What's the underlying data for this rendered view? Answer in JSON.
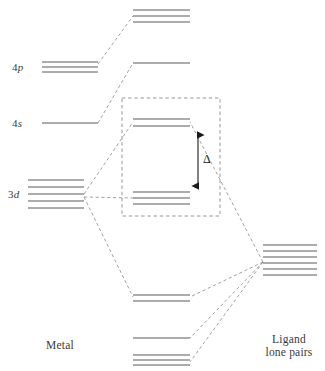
{
  "figure": {
    "type": "molecular-orbital-energy-diagram",
    "background_color": "#ffffff",
    "level_color": "#5a5a5a",
    "correlation_color": "#8a8a8a",
    "box_color": "#8a8a8a",
    "arrow_color": "#1a1a1a"
  },
  "labels": {
    "metal": "Metal",
    "ligand_line1": "Ligand",
    "ligand_line2": "lone pairs",
    "four_p_prefix": "4",
    "four_p_orbital": "p",
    "four_s_prefix": "4",
    "four_s_orbital": "s",
    "three_d_prefix": "3",
    "three_d_orbital": "d",
    "delta": "Δ"
  },
  "chart_data": {
    "type": "energy-level-diagram",
    "xlabel": "",
    "ylabel": "Energy",
    "grid": false,
    "legend": "none",
    "columns": [
      {
        "id": "metal",
        "name": "Metal",
        "x_center": 70,
        "levels": [
          {
            "id": "4p",
            "label": "4p",
            "degeneracy": 3,
            "x1": 42,
            "x2": 98,
            "y": [
              62,
              67,
              72
            ],
            "label_x": 12,
            "label_y": 61
          },
          {
            "id": "4s",
            "label": "4s",
            "degeneracy": 1,
            "x1": 42,
            "x2": 98,
            "y": [
              123
            ],
            "label_x": 12,
            "label_y": 117
          },
          {
            "id": "3d",
            "label": "3d",
            "degeneracy": 5,
            "x1": 28,
            "x2": 84,
            "y": [
              180,
              187,
              194,
              201,
              208
            ],
            "label_x": 8,
            "label_y": 188
          }
        ]
      },
      {
        "id": "molecular",
        "name": "Molecular orbitals",
        "x_center": 163,
        "levels": [
          {
            "id": "t1u-antibonding",
            "label": "t1u*",
            "degeneracy": 3,
            "x1": 133,
            "x2": 190,
            "y": [
              10,
              16,
              22
            ]
          },
          {
            "id": "a1g-antibonding",
            "label": "a1g*",
            "degeneracy": 1,
            "x1": 133,
            "x2": 190,
            "y": [
              63
            ]
          },
          {
            "id": "eg-antibonding",
            "label": "eg*",
            "degeneracy": 2,
            "x1": 133,
            "x2": 190,
            "y": [
              119,
              126
            ],
            "in_box": true
          },
          {
            "id": "t2g-nonbonding",
            "label": "t2g",
            "degeneracy": 3,
            "x1": 133,
            "x2": 190,
            "y": [
              192,
              198,
              204
            ],
            "in_box": true
          },
          {
            "id": "eg-bonding",
            "label": "eg",
            "degeneracy": 2,
            "x1": 133,
            "x2": 190,
            "y": [
              295,
              301
            ]
          },
          {
            "id": "a1g-bonding",
            "label": "a1g",
            "degeneracy": 1,
            "x1": 133,
            "x2": 190,
            "y": [
              338
            ]
          },
          {
            "id": "t1u-bonding",
            "label": "t1u",
            "degeneracy": 3,
            "x1": 133,
            "x2": 190,
            "y": [
              355,
              360,
              365
            ]
          }
        ]
      },
      {
        "id": "ligand",
        "name": "Ligand lone pairs",
        "x_center": 289,
        "levels": [
          {
            "id": "ligand-lone-pairs",
            "label": "Ligand lone pairs",
            "degeneracy": 6,
            "x1": 263,
            "x2": 317,
            "y": [
              245,
              251,
              257,
              263,
              269,
              275
            ]
          }
        ]
      }
    ],
    "splitting": {
      "symbol": "Δ",
      "from_level": "t2g-nonbonding",
      "to_level": "eg-antibonding",
      "arrow_x": 198,
      "arrow_y_top": 131,
      "arrow_y_bottom": 190,
      "label_x": 203,
      "label_y": 152
    },
    "box": {
      "x": 122,
      "y": 98,
      "width": 98,
      "height": 118,
      "style": "dashed",
      "encloses": [
        "eg-antibonding",
        "t2g-nonbonding"
      ]
    },
    "correlation_lines": [
      {
        "from": "4p",
        "to": "t1u-antibonding",
        "x1": 98,
        "y1": 64,
        "x2": 133,
        "y2": 16
      },
      {
        "from": "4s",
        "to": "a1g-antibonding",
        "x1": 98,
        "y1": 123,
        "x2": 133,
        "y2": 63
      },
      {
        "from": "3d",
        "to": "eg-antibonding",
        "x1": 84,
        "y1": 194,
        "x2": 133,
        "y2": 122
      },
      {
        "from": "3d",
        "to": "t2g-nonbonding",
        "x1": 84,
        "y1": 197,
        "x2": 133,
        "y2": 198
      },
      {
        "from": "3d",
        "to": "eg-bonding",
        "x1": 84,
        "y1": 197,
        "x2": 133,
        "y2": 297
      },
      {
        "from": "ligand",
        "to": "eg-antibonding",
        "x1": 263,
        "y1": 262,
        "x2": 190,
        "y2": 122
      },
      {
        "from": "ligand",
        "to": "eg-bonding",
        "x1": 263,
        "y1": 262,
        "x2": 190,
        "y2": 297
      },
      {
        "from": "ligand",
        "to": "a1g-bonding",
        "x1": 263,
        "y1": 262,
        "x2": 190,
        "y2": 338
      },
      {
        "from": "ligand",
        "to": "t1u-bonding",
        "x1": 263,
        "y1": 262,
        "x2": 190,
        "y2": 362
      }
    ],
    "group_labels": [
      {
        "id": "metal-label",
        "text": "Metal",
        "x": 60,
        "y": 339
      },
      {
        "id": "ligand-label",
        "text": "Ligand lone pairs",
        "x": 289,
        "y": 333
      }
    ]
  }
}
